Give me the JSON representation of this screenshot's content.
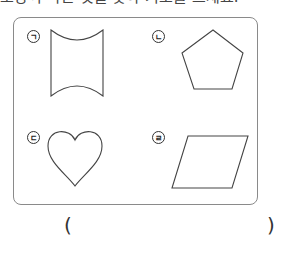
{
  "question": {
    "title_partial": "모양이 다른 것을 찾아 기호를 쓰세요."
  },
  "options": [
    {
      "marker": "ㄱ",
      "shape": "concave-curved-rectangle"
    },
    {
      "marker": "ㄴ",
      "shape": "pentagon"
    },
    {
      "marker": "ㄷ",
      "shape": "heart"
    },
    {
      "marker": "ㄹ",
      "shape": "parallelogram"
    }
  ],
  "answer": {
    "open_paren": "(",
    "close_paren": ")",
    "value": ""
  }
}
